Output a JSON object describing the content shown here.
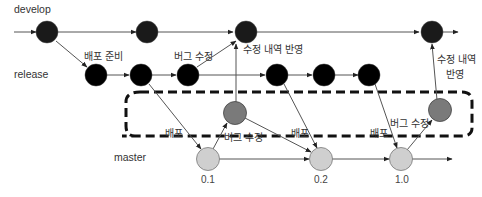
{
  "branches": {
    "develop": "develop",
    "release": "release",
    "master": "master"
  },
  "labels": {
    "prepare_release": "배포 준비",
    "bugfix_1": "버그 수정",
    "merge_changes_1": "수정 내역 반영",
    "merge_changes_2_line1": "수정 내역",
    "merge_changes_2_line2": "반영",
    "deploy_1": "배포",
    "deploy_2": "배포",
    "deploy_3": "배포",
    "hotfix_1": "버그 수정",
    "hotfix_2": "버그 수정"
  },
  "versions": {
    "v1": "0.1",
    "v2": "0.2",
    "v3": "1.0"
  },
  "colors": {
    "develop_node": "#1a1a1a",
    "release_node": "#000000",
    "hotfix_node": "#7a7a7a",
    "master_node": "#cfcfcf",
    "line": "#555555",
    "dashed_box": "#111111"
  }
}
